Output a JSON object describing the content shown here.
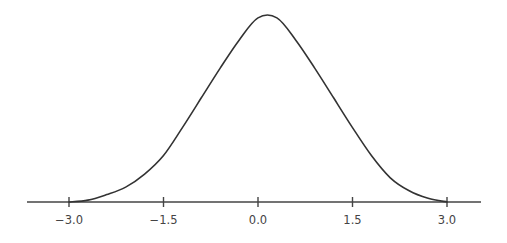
{
  "chart_data": {
    "type": "line",
    "title": "",
    "xlabel": "",
    "ylabel": "",
    "xlim": [
      -3.7,
      3.6
    ],
    "grid": false,
    "legend": null,
    "x_ticks": [
      -3.0,
      -1.5,
      0.0,
      1.5,
      3.0
    ],
    "x_tick_labels": [
      "−3.0",
      "−1.5",
      "0.0",
      "1.5",
      "3.0"
    ],
    "series": [
      {
        "name": "normal distribution curve",
        "x": [
          -3.0,
          -2.7,
          -2.4,
          -2.1,
          -1.8,
          -1.5,
          -1.2,
          -0.9,
          -0.6,
          -0.3,
          0.0,
          0.3,
          0.6,
          0.9,
          1.2,
          1.5,
          1.8,
          2.1,
          2.4,
          2.7,
          3.0
        ],
        "y": [
          0.0,
          0.01,
          0.04,
          0.08,
          0.15,
          0.25,
          0.4,
          0.56,
          0.72,
          0.87,
          0.99,
          0.99,
          0.87,
          0.72,
          0.56,
          0.4,
          0.25,
          0.13,
          0.06,
          0.02,
          0.0
        ]
      }
    ],
    "colors": {
      "curve": "#333333",
      "axis": "#444444",
      "text": "#444444"
    }
  }
}
